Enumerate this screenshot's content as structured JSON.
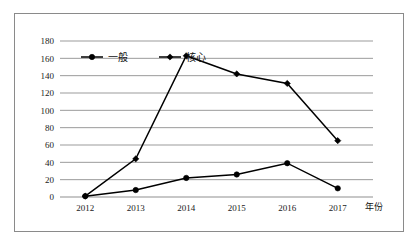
{
  "chart_data": {
    "type": "line",
    "title": "",
    "xlabel": "年份",
    "ylabel": "",
    "x": [
      "2012",
      "2013",
      "2014",
      "2015",
      "2016",
      "2017"
    ],
    "categories": [
      "2012",
      "2013",
      "2014",
      "2015",
      "2016",
      "2017"
    ],
    "ylim": [
      0,
      180
    ],
    "ytick_labels": [
      "0",
      "20",
      "40",
      "60",
      "80",
      "100",
      "120",
      "140",
      "160",
      "180"
    ],
    "ytick_values": [
      0,
      20,
      40,
      60,
      80,
      100,
      120,
      140,
      160,
      180
    ],
    "grid": true,
    "legend_position": "top-center",
    "series": [
      {
        "name": "一般",
        "marker": "circle",
        "color": "#000000",
        "values": [
          1,
          8,
          22,
          26,
          39,
          10
        ]
      },
      {
        "name": "核心",
        "marker": "diamond",
        "color": "#000000",
        "values": [
          1,
          44,
          163,
          142,
          131,
          65
        ]
      }
    ]
  },
  "legend": {
    "items": [
      {
        "label": "一般",
        "marker": "circle"
      },
      {
        "label": "核心",
        "marker": "diamond"
      }
    ]
  },
  "axis": {
    "x_axis_name": "年份"
  },
  "colors": {
    "series_line": "#000000",
    "gridline": "#909090",
    "frame_border": "#8a8a8a",
    "background": "#ffffff"
  }
}
